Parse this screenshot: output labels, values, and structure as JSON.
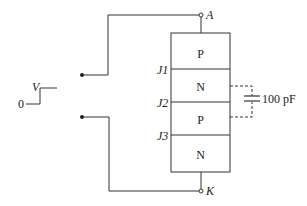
{
  "diagram": {
    "terminals": {
      "anode": "A",
      "cathode": "K"
    },
    "junctions": [
      "J1",
      "J2",
      "J3"
    ],
    "layers": [
      "P",
      "N",
      "P",
      "N"
    ],
    "capacitor": {
      "label": "100 pF"
    },
    "step_input": {
      "high_label": "V",
      "low_label": "0"
    }
  }
}
